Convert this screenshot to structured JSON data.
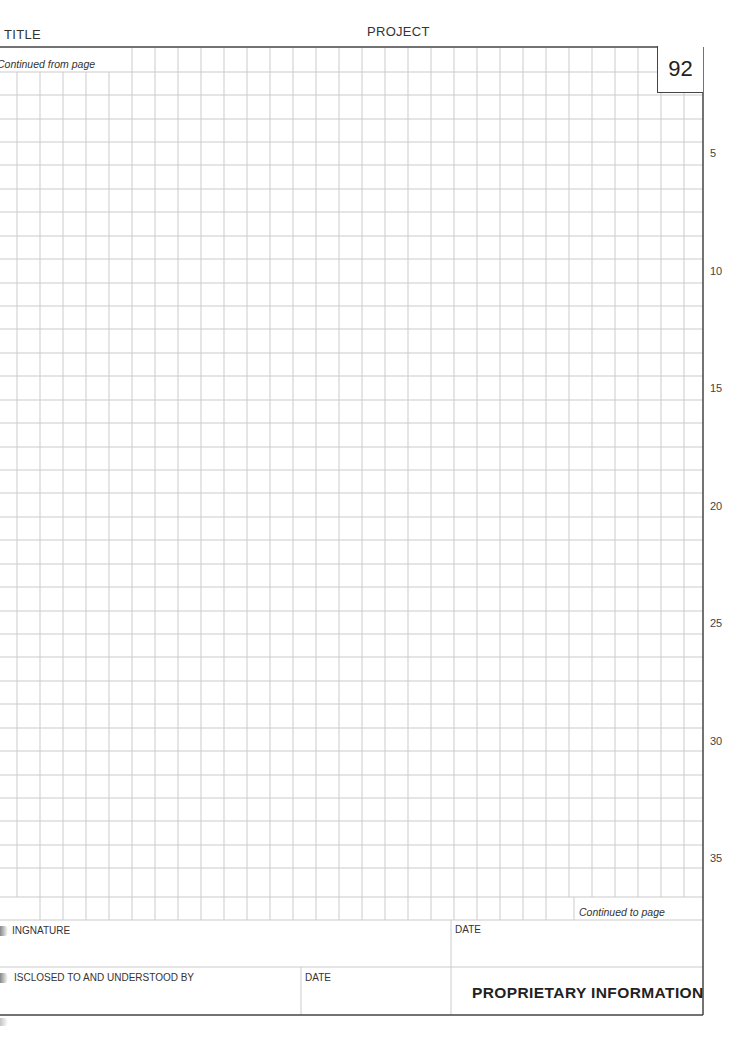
{
  "header": {
    "title_label": "TITLE",
    "project_label": "PROJECT"
  },
  "page": {
    "number": "92",
    "continued_from_label": "Continued from page",
    "continued_to_label": "Continued to page"
  },
  "line_numbers": [
    "5",
    "10",
    "15",
    "20",
    "25",
    "30",
    "35"
  ],
  "footer": {
    "signature_label": "INGNATURE",
    "date_label_1": "DATE",
    "disclosed_label": "ISCLOSED TO AND UNDERSTOOD BY",
    "date_label_2": "DATE",
    "proprietary_label": "PROPRIETARY INFORMATION"
  },
  "colors": {
    "grid_line": "#c8c8c8",
    "frame_line": "#444444",
    "text": "#333333"
  }
}
